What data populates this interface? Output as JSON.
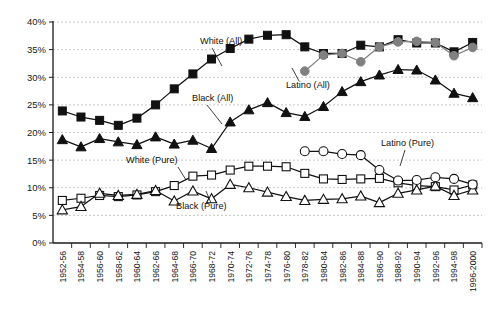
{
  "chart_data": {
    "type": "line",
    "title": "",
    "subtitle": "",
    "xlabel": "",
    "ylabel": "",
    "ylim": [
      0,
      40
    ],
    "yticks": [
      0,
      5,
      10,
      15,
      20,
      25,
      30,
      35,
      40
    ],
    "ytick_labels": [
      "0%",
      "5%",
      "10%",
      "15%",
      "20%",
      "25%",
      "30%",
      "35%",
      "40%"
    ],
    "grid": true,
    "legend_position": "inline-annotations",
    "categories": [
      "1952-56",
      "1954-58",
      "1956-60",
      "1958-62",
      "1960-64",
      "1962-66",
      "1964-68",
      "1966-70",
      "1968-72",
      "1970-74",
      "1972-76",
      "1974-78",
      "1976-80",
      "1978-82",
      "1980-84",
      "1982-86",
      "1984-88",
      "1986-90",
      "1988-92",
      "1990-94",
      "1992-96",
      "1994-98",
      "1996-2000"
    ],
    "series": [
      {
        "name": "White (All)",
        "marker": "filled-square",
        "color": "#111111",
        "values": [
          23.9,
          22.8,
          22.2,
          21.3,
          22.6,
          25.0,
          27.9,
          30.6,
          33.3,
          35.2,
          36.9,
          37.6,
          37.7,
          35.5,
          34.3,
          34.3,
          35.8,
          35.5,
          36.8,
          36.2,
          36.2,
          34.6,
          36.3
        ]
      },
      {
        "name": "Black (All)",
        "marker": "filled-triangle",
        "color": "#111111",
        "values": [
          18.7,
          17.4,
          18.9,
          18.3,
          17.8,
          19.2,
          17.9,
          18.6,
          17.1,
          21.9,
          24.1,
          25.4,
          23.6,
          22.9,
          24.7,
          27.4,
          29.2,
          30.4,
          31.4,
          31.3,
          29.5,
          27.1,
          26.3
        ]
      },
      {
        "name": "Latino (All)",
        "marker": "filled-circle",
        "color": "#808080",
        "values": [
          null,
          null,
          null,
          null,
          null,
          null,
          null,
          null,
          null,
          null,
          null,
          null,
          null,
          31.1,
          34.0,
          34.3,
          32.8,
          35.5,
          36.4,
          36.5,
          36.3,
          33.9,
          35.4
        ]
      },
      {
        "name": "White (Pure)",
        "marker": "open-square",
        "color": "#111111",
        "values": [
          7.7,
          8.1,
          8.6,
          8.4,
          8.7,
          9.3,
          10.4,
          12.1,
          12.3,
          13.2,
          13.9,
          13.9,
          13.8,
          12.6,
          11.6,
          11.5,
          11.6,
          11.7,
          10.9,
          10.4,
          10.2,
          9.6,
          10.5
        ]
      },
      {
        "name": "Black (Pure)",
        "marker": "open-triangle",
        "color": "#111111",
        "values": [
          6.0,
          6.6,
          9.0,
          8.6,
          8.8,
          9.5,
          7.6,
          9.4,
          8.0,
          10.6,
          10.0,
          9.2,
          8.4,
          7.7,
          7.9,
          8.0,
          8.5,
          7.3,
          9.0,
          9.6,
          10.3,
          8.6,
          9.6
        ]
      },
      {
        "name": "Latino (Pure)",
        "marker": "open-circle",
        "color": "#111111",
        "values": [
          null,
          null,
          null,
          null,
          null,
          null,
          null,
          null,
          null,
          null,
          null,
          null,
          null,
          16.6,
          16.6,
          16.1,
          15.9,
          13.2,
          11.3,
          11.4,
          11.9,
          11.6,
          10.6
        ]
      }
    ],
    "annotations": [
      {
        "text": "White (All)",
        "leader": true
      },
      {
        "text": "Black (All)",
        "leader": true
      },
      {
        "text": "Latino (All)",
        "leader": true
      },
      {
        "text": "White (Pure)",
        "leader": true
      },
      {
        "text": "Black (Pure)",
        "leader": true
      },
      {
        "text": "Latino (Pure)",
        "leader": true
      }
    ]
  }
}
